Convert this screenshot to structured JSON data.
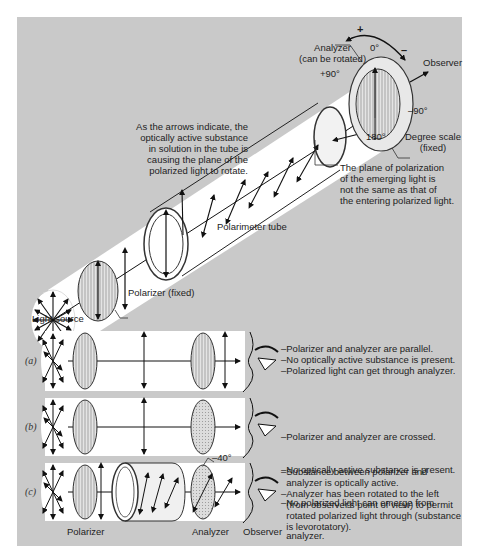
{
  "figure": {
    "top_diagram": {
      "analyzer_label": [
        "Analyzer",
        "(can be rotated)"
      ],
      "observer_label": "Observer",
      "rotation_plus": "+",
      "rotation_minus": "–",
      "angle_0": "0°",
      "angle_plus90": "+90°",
      "angle_minus90": "–90°",
      "angle_180": "180°",
      "degree_scale_label": [
        "Degree scale",
        "(fixed)"
      ],
      "arrows_note": [
        "As the arrows indicate, the",
        "optically active substance",
        "in solution in the tube is",
        "causing the plane of the",
        "polarized light to rotate."
      ],
      "emerging_note": [
        "The plane of polarization",
        "of the emerging light is",
        "not the same as that of",
        "the entering polarized light."
      ],
      "tube_label": "Polarimeter tube",
      "polarizer_label": "Polarizer (fixed)",
      "light_source_label": "Light source"
    },
    "panels": [
      {
        "tag": "(a)",
        "notes": [
          "–Polarizer and analyzer are parallel.",
          "–No optically active substance is present.",
          "–Polarized light can get through analyzer."
        ]
      },
      {
        "tag": "(b)",
        "notes": [
          "–Polarizer and analyzer are crossed.",
          "–No optically active substance is present.",
          "–No polarized light can emerge from",
          "  analyzer."
        ]
      },
      {
        "tag": "(c)",
        "angle": "–40°",
        "notes": [
          "–Substance between polarizer and",
          "  analyzer is optically active.",
          "–Analyzer has been rotated to the left",
          "  (from observer's point of view) to permit",
          "  rotated polarized light through (substance",
          "  is levorotatory)."
        ]
      }
    ],
    "bottom_labels": {
      "polarizer": "Polarizer",
      "analyzer": "Analyzer",
      "observer": "Observer"
    },
    "colors": {
      "panel": "#c9c9c9",
      "beam": "#ffffff",
      "ink": "#1a1a1a"
    }
  }
}
